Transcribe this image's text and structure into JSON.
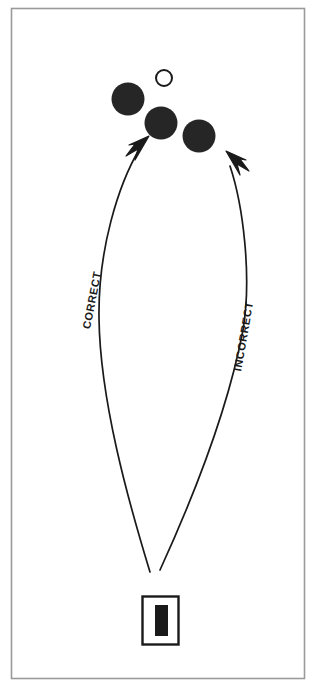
{
  "figure": {
    "title": "",
    "width": 318,
    "height": 689,
    "background_color": "#ffffff",
    "border_color": "#9a9a9a"
  },
  "labels": {
    "correct": "CORRECT",
    "incorrect": "INCORRECT"
  },
  "colors": {
    "ink": "#1a1a1a",
    "fill": "#262626",
    "stroke": "#1a1a1a",
    "frame": "#9a9a9a",
    "paper": "#ffffff"
  },
  "objects": {
    "open_circle": {
      "name": "target-ball-open",
      "filled": false,
      "cx": 164,
      "cy": 78,
      "r": 8
    },
    "filled_circles": [
      {
        "name": "ball-left",
        "cx": 128,
        "cy": 99,
        "r": 16
      },
      {
        "name": "ball-middle",
        "cx": 161,
        "cy": 123,
        "r": 16
      },
      {
        "name": "ball-right",
        "cx": 199,
        "cy": 136,
        "r": 16
      }
    ],
    "cue": {
      "name": "cue-block",
      "outer": {
        "x": 142,
        "y": 596,
        "width": 36,
        "height": 48
      },
      "inner": {
        "x": 155,
        "y": 605,
        "width": 13,
        "height": 31
      }
    },
    "trajectories": [
      {
        "name": "correct-path",
        "label": "CORRECT",
        "start": {
          "x": 150,
          "y": 572
        },
        "end": {
          "x": 148,
          "y": 138
        },
        "arrow_direction": "up-right"
      },
      {
        "name": "incorrect-path",
        "label": "INCORRECT",
        "start": {
          "x": 160,
          "y": 570
        },
        "end": {
          "x": 225,
          "y": 152
        },
        "arrow_direction": "up-left"
      }
    ]
  }
}
